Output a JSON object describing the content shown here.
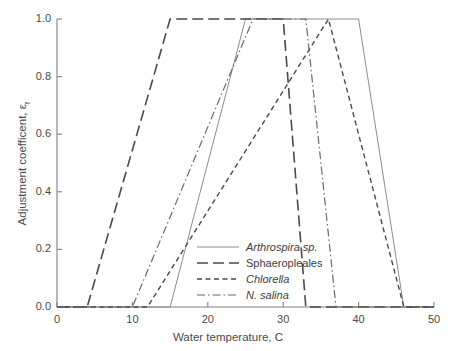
{
  "chart_data": {
    "type": "line",
    "title": "",
    "xlabel": "Water temperature, C",
    "ylabel_text": "Adjustment coefficent, ε",
    "ylabel_sub": "f",
    "xlim": [
      0,
      50
    ],
    "ylim": [
      0.0,
      1.0
    ],
    "xticks": [
      0,
      10,
      20,
      30,
      40,
      50
    ],
    "yticks": [
      0.0,
      0.2,
      0.4,
      0.6,
      0.8,
      1.0
    ],
    "xtick_labels": [
      "0",
      "10",
      "20",
      "30",
      "40",
      "50"
    ],
    "ytick_labels": [
      "0.0",
      "0.2",
      "0.4",
      "0.6",
      "0.8",
      "1.0"
    ],
    "grid": false,
    "legend_position": "center",
    "series": [
      {
        "name": "Arthrospira sp.",
        "italic": true,
        "style": "solid",
        "color": "#8c8c8c",
        "width": 1.0,
        "points": [
          [
            0,
            0.0
          ],
          [
            15,
            0.0
          ],
          [
            25,
            1.0
          ],
          [
            40,
            1.0
          ],
          [
            46,
            0.0
          ],
          [
            50,
            0.0
          ]
        ]
      },
      {
        "name": "Sphaeropleales",
        "italic": false,
        "style": "long-dash",
        "color": "#4a4a4a",
        "width": 1.6,
        "points": [
          [
            0,
            0.0
          ],
          [
            4,
            0.0
          ],
          [
            15,
            1.0
          ],
          [
            30,
            1.0
          ],
          [
            33,
            0.0
          ],
          [
            50,
            0.0
          ]
        ]
      },
      {
        "name": "Chlorella",
        "italic": true,
        "style": "short-dash",
        "color": "#4a4a4a",
        "width": 1.4,
        "points": [
          [
            0,
            0.0
          ],
          [
            12,
            0.0
          ],
          [
            36,
            1.0
          ],
          [
            46,
            0.0
          ],
          [
            50,
            0.0
          ]
        ]
      },
      {
        "name": "N. salina",
        "italic": true,
        "style": "dash-dot",
        "color": "#6a6a6a",
        "width": 1.2,
        "points": [
          [
            0,
            0.0
          ],
          [
            10,
            0.0
          ],
          [
            26,
            1.0
          ],
          [
            33,
            1.0
          ],
          [
            37,
            0.0
          ],
          [
            50,
            0.0
          ]
        ]
      }
    ]
  },
  "axes": {
    "spine_color": "#808080",
    "tick_color": "#808080"
  }
}
